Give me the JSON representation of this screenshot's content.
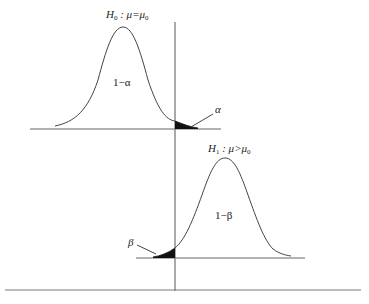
{
  "diagram": {
    "type": "hypothesis-test-distributions",
    "colors": {
      "line": "#555555",
      "fill": "#111111",
      "text": "#222222",
      "background": "#ffffff"
    },
    "null_distribution": {
      "hypothesis_label": "H",
      "hypothesis_sub": "0",
      "hypothesis_rest": " : μ=μ",
      "hypothesis_rest_sub": "0",
      "area_label": "1−α",
      "tail_label": "α"
    },
    "alt_distribution": {
      "hypothesis_label": "H",
      "hypothesis_sub": "1",
      "hypothesis_rest": " : μ>μ",
      "hypothesis_rest_sub": "0",
      "area_label": "1−β",
      "tail_label": "β"
    }
  }
}
